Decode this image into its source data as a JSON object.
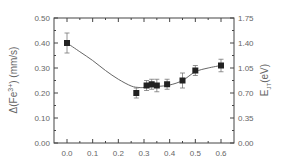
{
  "chart_data": {
    "type": "scatter",
    "title": "",
    "xlabel": "",
    "ylabel": "Δ(Fe3+) (mm/s)",
    "ylabel_parts": {
      "prefix": "Δ(Fe",
      "sup": "3+",
      "suffix": ") (mm/s)"
    },
    "y2label": "EJT(eV)",
    "y2label_parts": {
      "main": "E",
      "sub": "JT",
      "suffix": "(eV)"
    },
    "xlim": [
      -0.05,
      0.65
    ],
    "ylim": [
      0.0,
      0.5
    ],
    "y2lim": [
      0.0,
      1.75
    ],
    "x_ticks": [
      "0.0",
      "0.1",
      "0.2",
      "0.3",
      "0.4",
      "0.5",
      "0.6"
    ],
    "y_ticks": [
      "0.00",
      "0.10",
      "0.20",
      "0.30",
      "0.40",
      "0.50"
    ],
    "y2_ticks": [
      "0.00",
      "0.35",
      "0.70",
      "1.05",
      "1.40",
      "1.75"
    ],
    "grid": false,
    "legend": null,
    "series": [
      {
        "name": "Δ(Fe3+) data",
        "marker": "square",
        "x": [
          0.0,
          0.27,
          0.31,
          0.33,
          0.35,
          0.39,
          0.45,
          0.5,
          0.6
        ],
        "y": [
          0.4,
          0.2,
          0.23,
          0.235,
          0.23,
          0.235,
          0.25,
          0.29,
          0.31
        ],
        "yerr": [
          0.04,
          0.02,
          0.02,
          0.02,
          0.025,
          0.02,
          0.03,
          0.02,
          0.025
        ]
      },
      {
        "name": "EJT fit curve",
        "style": "line",
        "x": [
          0.0,
          0.05,
          0.1,
          0.15,
          0.2,
          0.25,
          0.28,
          0.3,
          0.35,
          0.4,
          0.45,
          0.5,
          0.55,
          0.6
        ],
        "y": [
          0.4,
          0.365,
          0.33,
          0.29,
          0.255,
          0.228,
          0.222,
          0.222,
          0.226,
          0.232,
          0.25,
          0.285,
          0.3,
          0.31
        ]
      }
    ]
  }
}
